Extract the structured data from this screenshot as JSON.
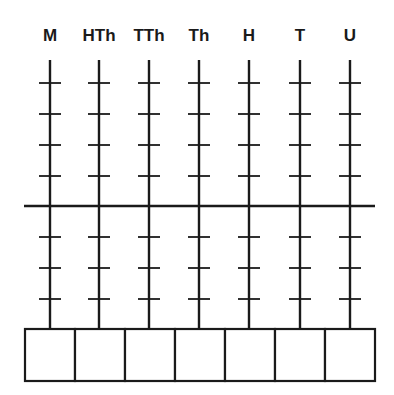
{
  "diagram": {
    "type": "place-value-abacus",
    "columns": [
      {
        "label": "M",
        "x": 50
      },
      {
        "label": "HTh",
        "x": 99
      },
      {
        "label": "TTh",
        "x": 149
      },
      {
        "label": "Th",
        "x": 199
      },
      {
        "label": "H",
        "x": 249
      },
      {
        "label": "T",
        "x": 300
      },
      {
        "label": "U",
        "x": 350
      }
    ],
    "ticks_above_bar": 4,
    "ticks_below_bar": 3,
    "answer_boxes": [
      "",
      "",
      "",
      "",
      "",
      "",
      ""
    ],
    "line_color": "#1a1a1a"
  }
}
